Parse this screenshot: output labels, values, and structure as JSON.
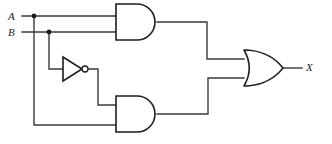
{
  "figure": {
    "kind": "logic-circuit-diagram",
    "width": 332,
    "height": 144,
    "background_color": "#ffffff",
    "wire_color": "#3a3a3a",
    "gate_outline_color": "#1d1d1d",
    "label_color": "#1d1d1d"
  },
  "labels": {
    "input_a": "A",
    "input_b": "B",
    "output_x": "X"
  },
  "gates": [
    {
      "id": "and-top",
      "type": "AND",
      "symbol_text": "AND",
      "inputs": [
        "A",
        "B"
      ],
      "output": "A·B"
    },
    {
      "id": "not-b",
      "type": "NOT",
      "symbol_text": "NOT",
      "inputs": [
        "B"
      ],
      "output": "B'"
    },
    {
      "id": "and-bottom",
      "type": "AND",
      "symbol_text": "AND",
      "inputs": [
        "B'",
        "A"
      ],
      "output": "A·B'"
    },
    {
      "id": "or-out",
      "type": "OR",
      "symbol_text": "OR",
      "inputs": [
        "A·B",
        "A·B'"
      ],
      "output": "X"
    }
  ],
  "nets": [
    {
      "id": "net-a",
      "from": "A",
      "to": [
        "and-top.in1",
        "and-bottom.in2"
      ],
      "junction": true
    },
    {
      "id": "net-b",
      "from": "B",
      "to": [
        "and-top.in2",
        "not-b.in"
      ],
      "junction": true
    },
    {
      "id": "net-nb",
      "from": "not-b.out",
      "to": [
        "and-bottom.in1"
      ],
      "junction": false
    },
    {
      "id": "net-t",
      "from": "and-top.out",
      "to": [
        "or-out.in1"
      ],
      "junction": false
    },
    {
      "id": "net-m",
      "from": "and-bottom.out",
      "to": [
        "or-out.in2"
      ],
      "junction": false
    },
    {
      "id": "net-x",
      "from": "or-out.out",
      "to": [
        "X"
      ],
      "junction": false
    }
  ],
  "junction_dots": [
    {
      "id": "dot-a",
      "x": 34,
      "y": 16
    },
    {
      "id": "dot-b",
      "x": 49,
      "y": 32
    }
  ]
}
